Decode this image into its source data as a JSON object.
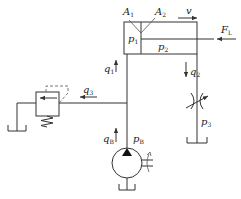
{
  "diagram": {
    "type": "hydraulic-circuit",
    "components": {
      "cylinder": {
        "labels": {
          "area_rodless": {
            "main": "A",
            "sub": "1"
          },
          "area_rod": {
            "main": "A",
            "sub": "2"
          },
          "pressure_rodless": {
            "main": "p",
            "sub": "1"
          },
          "pressure_rod": {
            "main": "p",
            "sub": "2"
          },
          "velocity": "v",
          "load": {
            "main": "F",
            "sub": "L"
          }
        }
      },
      "relief_valve": {
        "flow_label": {
          "main": "q",
          "sub": "3"
        }
      },
      "throttle_valve": {
        "flow_label": {
          "main": "q",
          "sub": "2"
        },
        "pressure_label": {
          "main": "p",
          "sub": "3"
        }
      },
      "pump": {
        "flow_label": {
          "main": "q",
          "sub": "B"
        },
        "pressure_label": {
          "main": "p",
          "sub": "B"
        }
      },
      "supply_line": {
        "flow_label": {
          "main": "q",
          "sub": "1"
        }
      }
    },
    "colors": {
      "line": "#333333",
      "background": "#ffffff"
    }
  }
}
